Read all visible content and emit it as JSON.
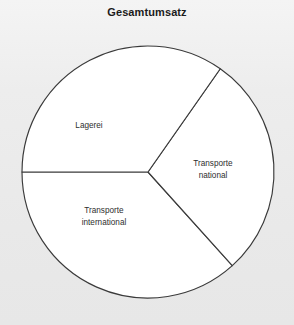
{
  "chart": {
    "title": "Gesamtumsatz"
  },
  "chart_data": {
    "type": "pie",
    "title": "Gesamtumsatz",
    "xlabel": "",
    "ylabel": "",
    "legend": "none",
    "grid": false,
    "labels_position": "inside-slices",
    "style": {
      "slice_fill": "#ffffff",
      "slice_stroke": "#3a3a3a",
      "background": "#ebebeb",
      "label_color": "#2e2e2e",
      "title_color": "#1b1b1b"
    },
    "geometry": {
      "center_x": 148,
      "center_y": 172,
      "radius": 126,
      "start_angle_deg": 180,
      "direction": "counterclockwise"
    },
    "categories": [
      "Lagerei",
      "Transporte national",
      "Transporte international"
    ],
    "values": [
      36.6,
      28.7,
      34.7
    ],
    "units": "percent",
    "slices": [
      {
        "label": "Lagerei",
        "label_lines": [
          "Lagerei"
        ],
        "value": 36.6,
        "angle_deg": 132,
        "start_angle_deg": 180,
        "end_angle_deg": 312,
        "label_x": 89,
        "label_y": 128
      },
      {
        "label": "Transporte national",
        "label_lines": [
          "Transporte",
          "national"
        ],
        "value": 28.7,
        "angle_deg": 103,
        "start_angle_deg": 312,
        "end_angle_deg": 55,
        "label_x": 213,
        "label_y": 172
      },
      {
        "label": "Transporte international",
        "label_lines": [
          "Transporte",
          "international"
        ],
        "value": 34.7,
        "angle_deg": 125,
        "start_angle_deg": 55,
        "end_angle_deg": 180,
        "label_x": 104,
        "label_y": 219
      }
    ]
  }
}
